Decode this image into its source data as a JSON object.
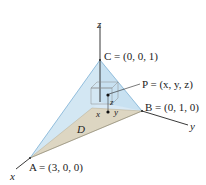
{
  "diagram": {
    "type": "3d-tetrahedron",
    "axes": {
      "x_label": "x",
      "y_label": "y",
      "z_label": "z"
    },
    "vertices": {
      "A": {
        "label": "A = (3, 0, 0)"
      },
      "B": {
        "label": "B = (0, 1, 0)"
      },
      "C": {
        "label": "C = (0, 0, 1)"
      }
    },
    "point": {
      "label": "P = (x, y, z)"
    },
    "box_labels": {
      "x": "x",
      "y": "y",
      "z": "z"
    },
    "region": {
      "label": "D"
    },
    "colors": {
      "face_blue": "#cfe4f2",
      "face_blue_edge": "#7fb3d6",
      "floor": "#ddd6c2",
      "axis": "#222222"
    }
  }
}
